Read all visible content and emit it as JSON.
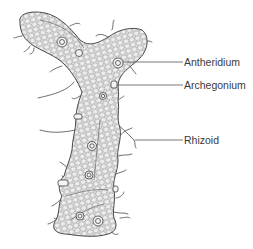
{
  "diagram": {
    "labels": [
      {
        "id": "antheridium",
        "text": "Antheridium"
      },
      {
        "id": "archegonium",
        "text": "Archegonium"
      },
      {
        "id": "rhizoid",
        "text": "Rhizoid"
      }
    ]
  },
  "colors": {
    "outline": "#4a4a4a",
    "mesh": "#6a6a6a",
    "fill": "#e9e9e9",
    "leader_line": "#555555",
    "text": "#3a3a3a"
  }
}
